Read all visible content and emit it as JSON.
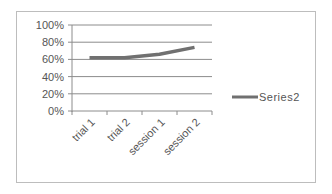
{
  "chart_data": {
    "type": "line",
    "title": "",
    "xlabel": "",
    "ylabel": "",
    "categories": [
      "trial 1",
      "trial 2",
      "session 1",
      "session 2"
    ],
    "series": [
      {
        "name": "Series2",
        "values": [
          0.62,
          0.62,
          0.66,
          0.74
        ],
        "color": "#707070"
      }
    ],
    "ylim": [
      0,
      1
    ],
    "yticks": [
      "0%",
      "20%",
      "40%",
      "60%",
      "80%",
      "100%"
    ],
    "grid": true,
    "legend_position": "right"
  },
  "legend": {
    "label": "Series2"
  },
  "colors": {
    "line": "#707070",
    "grid": "#8c8c8c",
    "axis": "#8c8c8c",
    "frame": "#bdbdbd",
    "text": "#555555"
  }
}
